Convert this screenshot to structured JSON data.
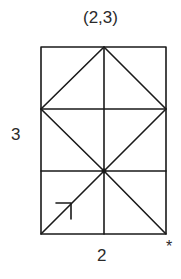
{
  "diagram": {
    "title": "(2,3)",
    "height_label": "3",
    "width_label": "2",
    "corner_mark": "*",
    "grid": {
      "columns": 2,
      "rows": 3
    },
    "colors": {
      "line": "#1a1a1a",
      "background": "#ffffff"
    },
    "shapes": {
      "rectangle": {
        "x1": 41,
        "y1": 47,
        "x2": 166,
        "y2": 234
      },
      "horizontal_lines_y": [
        109,
        171
      ],
      "vertical_line_x": 104,
      "diamond": [
        [
          104,
          47
        ],
        [
          41,
          109
        ],
        [
          104,
          171
        ],
        [
          166,
          109
        ]
      ],
      "center_point": [
        104,
        171
      ],
      "lines_from_center": [
        [
          41,
          234
        ],
        [
          166,
          234
        ]
      ],
      "arrow": {
        "from": [
          41,
          234
        ],
        "toward": [
          104,
          171
        ],
        "head_at": [
          71,
          203
        ]
      }
    }
  }
}
